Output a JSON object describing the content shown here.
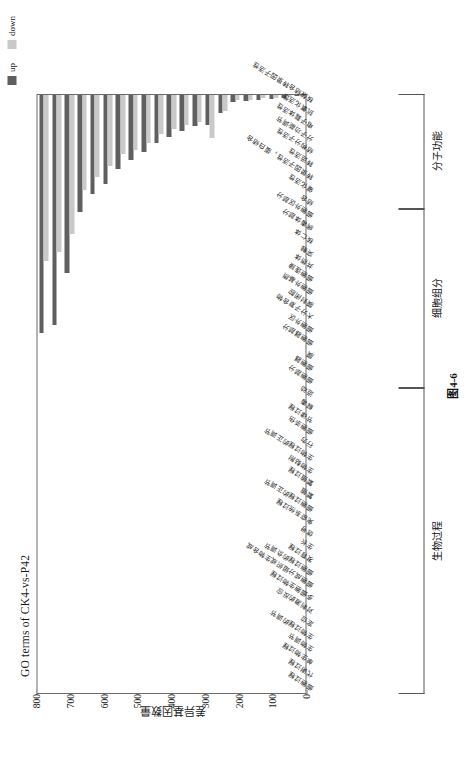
{
  "figure": {
    "title": "GO terms of CK4-vs-P42",
    "caption": "图4-6",
    "y_axis_label": "差异基因数量"
  },
  "legend": {
    "position": "top-right",
    "items": [
      {
        "label": "up",
        "color": "#5f5f5f"
      },
      {
        "label": "down",
        "color": "#c9c9c9"
      }
    ]
  },
  "groups": [
    {
      "name": "生物过程",
      "start": 0,
      "end": 24
    },
    {
      "name": "细胞组分",
      "start": 24,
      "end": 38
    },
    {
      "name": "分子功能",
      "start": 38,
      "end": 47
    }
  ],
  "chart_data": {
    "type": "bar",
    "title": "GO terms of CK4-vs-P42",
    "xlabel": "",
    "ylabel": "差异基因数量",
    "ylim": [
      0,
      800
    ],
    "yticks": [
      0,
      100,
      200,
      300,
      400,
      500,
      600,
      700,
      800
    ],
    "grid": false,
    "orientation": "vertical-grouped",
    "legend_position": "top-right",
    "categories": [
      "细胞过程",
      "代谢过程",
      "单生物过程",
      "生物调节",
      "生物过程的调节",
      "定位",
      "对刺激的反应",
      "多细胞生物过程",
      "细胞成分组织或生物合成",
      "细胞过程的负调节",
      "发育过程",
      "生长",
      "信号",
      "免疫系统过程",
      "细胞过程的正调节",
      "繁殖",
      "繁殖过程",
      "生物黏附",
      "生物过程的正调节",
      "行为",
      "细胞杀伤",
      "节律过程",
      "解毒",
      "运动",
      "细胞部分",
      "细胞器",
      "膜",
      "细胞器部分",
      "细胞外区",
      "大分子复合物",
      "膜封闭腔",
      "细胞外基质",
      "细胞连接",
      "共质体",
      "突触",
      "核仁体",
      "病毒体部分",
      "细胞外区部分",
      "结合",
      "催化活性",
      "转录因子活性，蛋白结合",
      "转运活性",
      "结构分子活性",
      "分子功能调节",
      "电子载体活性",
      "抗氧化活性",
      "核酸结合转录因子活性"
    ],
    "series": [
      {
        "name": "up",
        "color": "#5f5f5f",
        "values": [
          712,
          688,
          532,
          352,
          300,
          270,
          224,
          198,
          174,
          148,
          130,
          112,
          98,
          96,
          60,
          26,
          24,
          20,
          18,
          14,
          10,
          8,
          4,
          3,
          520,
          506,
          390,
          312,
          250,
          226,
          200,
          152,
          120,
          50,
          24,
          14,
          8,
          4,
          742,
          452,
          104,
          62,
          26,
          22,
          16,
          10,
          6
        ]
      },
      {
        "name": "down",
        "color": "#c9c9c9",
        "values": [
          498,
          470,
          418,
          288,
          248,
          216,
          180,
          168,
          148,
          122,
          108,
          94,
          86,
          132,
          52,
          22,
          20,
          16,
          14,
          12,
          8,
          6,
          3,
          2,
          406,
          398,
          306,
          250,
          196,
          182,
          160,
          124,
          96,
          40,
          20,
          12,
          6,
          3,
          450,
          356,
          88,
          50,
          22,
          18,
          13,
          8,
          5
        ]
      }
    ]
  }
}
